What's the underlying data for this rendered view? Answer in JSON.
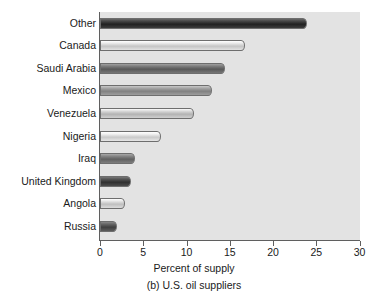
{
  "figure": {
    "caption": "(b) U.S. oil suppliers"
  },
  "chart_data": {
    "type": "bar",
    "orientation": "horizontal",
    "title": "",
    "subtitle": "",
    "caption": "(b) U.S. oil suppliers",
    "xlabel": "Percent of supply",
    "ylabel": "",
    "xlim": [
      0,
      30
    ],
    "xticks": [
      0,
      5,
      10,
      15,
      20,
      25,
      30
    ],
    "xtick_labels": [
      "0",
      "5",
      "10",
      "15",
      "20",
      "25",
      "30"
    ],
    "grid": false,
    "legend": "none",
    "plot_background": "#e3e3e3",
    "categories": [
      "Other",
      "Canada",
      "Saudi Arabia",
      "Mexico",
      "Venezuela",
      "Nigeria",
      "Iraq",
      "United Kingdom",
      "Angola",
      "Russia"
    ],
    "values": [
      23.9,
      16.8,
      14.4,
      13.0,
      10.9,
      7.0,
      4.0,
      3.6,
      2.9,
      2.0
    ],
    "bar_colors": [
      "#2b2b2b",
      "#cfcfcf",
      "#636363",
      "#8b8b8b",
      "#bdbdbd",
      "#d4d4d4",
      "#6b6b6b",
      "#3a3a3a",
      "#c9c9c9",
      "#4a4a4a"
    ],
    "bars": [
      {
        "category": "Other",
        "value": 23.9,
        "color": "#2b2b2b"
      },
      {
        "category": "Canada",
        "value": 16.8,
        "color": "#cfcfcf"
      },
      {
        "category": "Saudi Arabia",
        "value": 14.4,
        "color": "#636363"
      },
      {
        "category": "Mexico",
        "value": 13.0,
        "color": "#8b8b8b"
      },
      {
        "category": "Venezuela",
        "value": 10.9,
        "color": "#bdbdbd"
      },
      {
        "category": "Nigeria",
        "value": 7.0,
        "color": "#d4d4d4"
      },
      {
        "category": "Iraq",
        "value": 4.0,
        "color": "#6b6b6b"
      },
      {
        "category": "United Kingdom",
        "value": 3.6,
        "color": "#3a3a3a"
      },
      {
        "category": "Angola",
        "value": 2.9,
        "color": "#c9c9c9"
      },
      {
        "category": "Russia",
        "value": 2.0,
        "color": "#4a4a4a"
      }
    ]
  }
}
